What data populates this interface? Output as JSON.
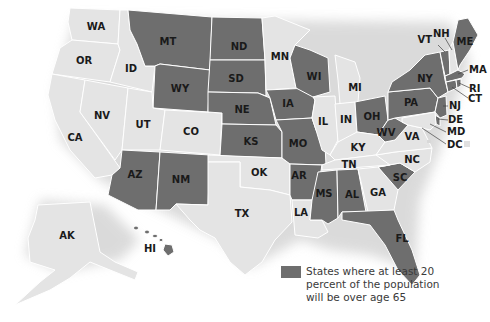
{
  "map": {
    "title": "",
    "colors": {
      "highlighted": "#6e6e6e",
      "other": "#e4e4e4",
      "border": "#ffffff",
      "shadow": "#cfcfcf"
    },
    "states": {
      "WA": {
        "label": "WA",
        "highlighted": false
      },
      "OR": {
        "label": "OR",
        "highlighted": false
      },
      "CA": {
        "label": "CA",
        "highlighted": false
      },
      "ID": {
        "label": "ID",
        "highlighted": false
      },
      "NV": {
        "label": "NV",
        "highlighted": false
      },
      "MT": {
        "label": "MT",
        "highlighted": true
      },
      "WY": {
        "label": "WY",
        "highlighted": true
      },
      "UT": {
        "label": "UT",
        "highlighted": false
      },
      "CO": {
        "label": "CO",
        "highlighted": false
      },
      "AZ": {
        "label": "AZ",
        "highlighted": true
      },
      "NM": {
        "label": "NM",
        "highlighted": true
      },
      "ND": {
        "label": "ND",
        "highlighted": true
      },
      "SD": {
        "label": "SD",
        "highlighted": true
      },
      "NE": {
        "label": "NE",
        "highlighted": true
      },
      "KS": {
        "label": "KS",
        "highlighted": true
      },
      "OK": {
        "label": "OK",
        "highlighted": false
      },
      "TX": {
        "label": "TX",
        "highlighted": false
      },
      "MN": {
        "label": "MN",
        "highlighted": false
      },
      "IA": {
        "label": "IA",
        "highlighted": true
      },
      "MO": {
        "label": "MO",
        "highlighted": true
      },
      "AR": {
        "label": "AR",
        "highlighted": true
      },
      "LA": {
        "label": "LA",
        "highlighted": false
      },
      "WI": {
        "label": "WI",
        "highlighted": true
      },
      "IL": {
        "label": "IL",
        "highlighted": false
      },
      "MI": {
        "label": "MI",
        "highlighted": false
      },
      "IN": {
        "label": "IN",
        "highlighted": false
      },
      "OH": {
        "label": "OH",
        "highlighted": true
      },
      "KY": {
        "label": "KY",
        "highlighted": false
      },
      "TN": {
        "label": "TN",
        "highlighted": false
      },
      "MS": {
        "label": "MS",
        "highlighted": true
      },
      "AL": {
        "label": "AL",
        "highlighted": true
      },
      "GA": {
        "label": "GA",
        "highlighted": false
      },
      "FL": {
        "label": "FL",
        "highlighted": true
      },
      "SC": {
        "label": "SC",
        "highlighted": true
      },
      "NC": {
        "label": "NC",
        "highlighted": false
      },
      "VA": {
        "label": "VA",
        "highlighted": false
      },
      "WV": {
        "label": "WV",
        "highlighted": true
      },
      "PA": {
        "label": "PA",
        "highlighted": true
      },
      "NY": {
        "label": "NY",
        "highlighted": true
      },
      "VT": {
        "label": "VT",
        "highlighted": true
      },
      "NH": {
        "label": "NH",
        "highlighted": false
      },
      "ME": {
        "label": "ME",
        "highlighted": true
      },
      "MA": {
        "label": "MA",
        "highlighted": true
      },
      "RI": {
        "label": "RI",
        "highlighted": true
      },
      "CT": {
        "label": "CT",
        "highlighted": true
      },
      "NJ": {
        "label": "NJ",
        "highlighted": true
      },
      "DE": {
        "label": "DE",
        "highlighted": true
      },
      "MD": {
        "label": "MD",
        "highlighted": false
      },
      "DC": {
        "label": "DC",
        "highlighted": false
      },
      "AK": {
        "label": "AK",
        "highlighted": false
      },
      "HI": {
        "label": "HI",
        "highlighted": true
      }
    }
  },
  "legend": {
    "swatch_color": "#6e6e6e",
    "text": "States where at least 20 percent of the population will be over age 65"
  }
}
